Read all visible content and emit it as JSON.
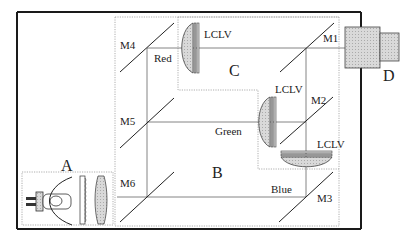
{
  "diagram": {
    "regions": {
      "A": "A",
      "B": "B",
      "C": "C",
      "D": "D"
    },
    "mirrors": {
      "M1": "M1",
      "M2": "M2",
      "M3": "M3",
      "M4": "M4",
      "M5": "M5",
      "M6": "M6"
    },
    "beams": {
      "red": "Red",
      "green": "Green",
      "blue": "Blue"
    },
    "lclv": {
      "red": "LCLV",
      "green": "LCLV",
      "blue": "LCLV"
    },
    "colors": {
      "frame": "#1a1a1a",
      "line": "#555555",
      "dotted": "#9a9a9a",
      "fill": "#d6d6d6",
      "projector": "#cfcfcf"
    }
  }
}
